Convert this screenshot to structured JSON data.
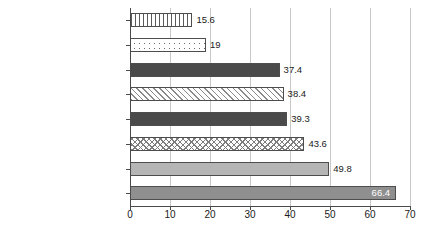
{
  "chart_data": {
    "type": "bar",
    "orientation": "horizontal",
    "title": "",
    "xlabel": "",
    "ylabel": "",
    "xlim": [
      0,
      70
    ],
    "xticks": [
      0,
      10,
      20,
      30,
      40,
      50,
      60,
      70
    ],
    "xtick_labels": [
      "0",
      "10",
      "20",
      "30",
      "40",
      "50",
      "60",
      "70"
    ],
    "grid": "vertical-gridlines-at-xticks",
    "legend": "none",
    "categories": [
      "Homesick",
      "Financial reasons",
      "Difficult coursework",
      "Personal reasons",
      "Lack of support group",
      "Unwelcoming climate",
      "Unsatisfactory social life",
      "Lack of sense of belonging"
    ],
    "values": [
      15.6,
      19,
      37.4,
      38.4,
      39.3,
      43.6,
      49.8,
      66.4
    ],
    "value_labels": [
      "15.6",
      "19",
      "37.4",
      "38.4",
      "39.3",
      "43.6",
      "49.8",
      "66.4"
    ],
    "bars": [
      {
        "category": "Homesick",
        "value": 15.6,
        "label": "15.6",
        "fill": "vertical-stripes",
        "fill_class": "fill-vstripe",
        "label_position": "outside"
      },
      {
        "category": "Financial reasons",
        "value": 19,
        "label": "19",
        "fill": "dots",
        "fill_class": "fill-dots",
        "label_position": "outside"
      },
      {
        "category": "Difficult coursework",
        "value": 37.4,
        "label": "37.4",
        "fill": "dark-solid",
        "fill_class": "fill-darksolid",
        "label_position": "outside"
      },
      {
        "category": "Personal reasons",
        "value": 38.4,
        "label": "38.4",
        "fill": "diagonal-hatch",
        "fill_class": "fill-diag",
        "label_position": "outside"
      },
      {
        "category": "Lack of support group",
        "value": 39.3,
        "label": "39.3",
        "fill": "dark-solid",
        "fill_class": "fill-darksolid",
        "label_position": "outside"
      },
      {
        "category": "Unwelcoming climate",
        "value": 43.6,
        "label": "43.6",
        "fill": "cross-hatch",
        "fill_class": "fill-cross",
        "label_position": "outside"
      },
      {
        "category": "Unsatisfactory social life",
        "value": 49.8,
        "label": "49.8",
        "fill": "light-gray-solid",
        "fill_class": "fill-lightsolid",
        "label_position": "outside"
      },
      {
        "category": "Lack of sense of belonging",
        "value": 66.4,
        "label": "66.4",
        "fill": "medium-gray-solid",
        "fill_class": "fill-medsolid",
        "label_position": "inside"
      }
    ],
    "colors": {
      "dark_solid": "#4a4a4a",
      "medium_gray": "#8f8f8f",
      "light_gray": "#b5b5b5",
      "bar_outline": "#4d4d4d",
      "gridline": "#c8c8c8",
      "axis": "#4a4a4a",
      "text": "#1a1a1a",
      "inside_label_text": "#ffffff",
      "background": "#ffffff"
    }
  }
}
